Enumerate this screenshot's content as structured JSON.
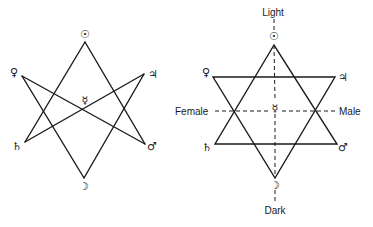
{
  "left_figure": {
    "planets": {
      "sun": "☉",
      "venus": "♀",
      "jupiter": "♃",
      "mercury": "☿",
      "saturn": "♄",
      "mars": "♂",
      "moon": "☽"
    }
  },
  "right_figure": {
    "labels": {
      "light": "Light",
      "dark": "Dark",
      "female": "Female",
      "male": "Male"
    },
    "planets": {
      "sun": "☉",
      "venus": "♀",
      "jupiter": "♃",
      "mercury": "☿",
      "saturn": "♄",
      "mars": "♂",
      "moon": "☽"
    }
  },
  "colors": {
    "ink": "#1a1a1a",
    "background": "#ffffff"
  }
}
